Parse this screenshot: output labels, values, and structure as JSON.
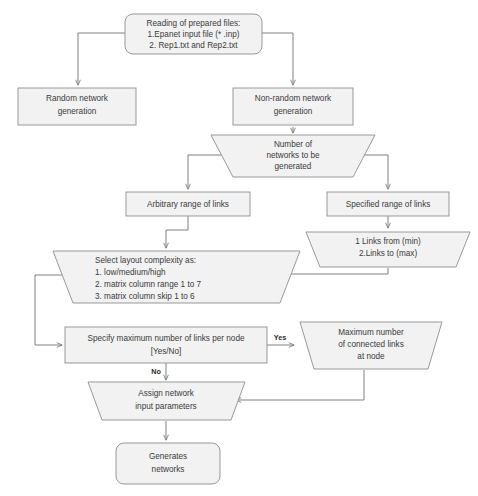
{
  "diagram": {
    "colors": {
      "node_fill": "#f2f2f2",
      "node_stroke": "#999999",
      "connector_stroke": "#808080",
      "text": "#3a3a3a",
      "background": "#ffffff"
    },
    "nodes": {
      "reading_files": {
        "shape": "rounded-rectangle",
        "lines": [
          "Reading of prepared files:",
          "1.Epanet input file (* .inp)",
          "2. Rep1.txt and Rep2.txt"
        ]
      },
      "random_generation": {
        "shape": "rectangle",
        "lines": [
          "Random network",
          "generation"
        ]
      },
      "nonrandom_generation": {
        "shape": "rectangle",
        "lines": [
          "Non-random network",
          "generation"
        ]
      },
      "number_of_networks": {
        "shape": "trapezoid",
        "lines": [
          "Number of",
          "networks to be",
          "generated"
        ]
      },
      "arbitrary_range": {
        "shape": "rectangle",
        "lines": [
          "Arbitrary range of links"
        ]
      },
      "specified_range": {
        "shape": "rectangle",
        "lines": [
          "Specified range of links"
        ]
      },
      "links_min_max": {
        "shape": "trapezoid",
        "lines": [
          "1 Links from (min)",
          "2.Links to (max)"
        ]
      },
      "layout_complexity": {
        "shape": "trapezoid",
        "lines": [
          "Select layout complexity as:",
          "1.    low/medium/high",
          "2.    matrix column range 1 to 7",
          "3.    matrix column skip 1 to 6"
        ]
      },
      "specify_max_links": {
        "shape": "rectangle",
        "lines": [
          "Specify maximum number of links per node",
          "[Yes/No]"
        ]
      },
      "max_connected_links": {
        "shape": "trapezoid",
        "lines": [
          "Maximum number",
          "of connected links",
          "at node"
        ]
      },
      "assign_parameters": {
        "shape": "trapezoid",
        "lines": [
          "Assign network",
          "input parameters"
        ]
      },
      "generates_networks": {
        "shape": "rounded-rectangle",
        "lines": [
          "Generates",
          "networks"
        ]
      }
    },
    "edge_labels": {
      "yes": "Yes",
      "no": "No"
    }
  }
}
